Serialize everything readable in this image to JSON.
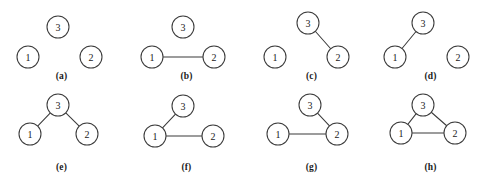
{
  "figure": {
    "node_radius": 11,
    "stroke_color": "#3b3b3b",
    "background_color": "#ffffff",
    "panels": [
      {
        "caption": "(a)",
        "origin": [
          0,
          0
        ],
        "caption_y": 71,
        "nodes": [
          {
            "label": "3",
            "x": 58,
            "y": 27
          },
          {
            "label": "1",
            "x": 28,
            "y": 57
          },
          {
            "label": "2",
            "x": 91,
            "y": 57
          }
        ],
        "edges": []
      },
      {
        "caption": "(b)",
        "origin": [
          125,
          0
        ],
        "caption_y": 71,
        "nodes": [
          {
            "label": "3",
            "x": 58,
            "y": 27
          },
          {
            "label": "1",
            "x": 27,
            "y": 57
          },
          {
            "label": "2",
            "x": 89,
            "y": 57
          }
        ],
        "edges": [
          {
            "from": "1",
            "to": "2"
          }
        ]
      },
      {
        "caption": "(c)",
        "origin": [
          250,
          0
        ],
        "caption_y": 71,
        "nodes": [
          {
            "label": "3",
            "x": 58,
            "y": 23
          },
          {
            "label": "1",
            "x": 25,
            "y": 57
          },
          {
            "label": "2",
            "x": 88,
            "y": 57
          }
        ],
        "edges": [
          {
            "from": "3",
            "to": "2"
          }
        ]
      },
      {
        "caption": "(d)",
        "origin": [
          369,
          0
        ],
        "caption_y": 71,
        "nodes": [
          {
            "label": "3",
            "x": 54,
            "y": 23
          },
          {
            "label": "1",
            "x": 26,
            "y": 57
          },
          {
            "label": "2",
            "x": 89,
            "y": 57
          }
        ],
        "edges": [
          {
            "from": "1",
            "to": "3"
          }
        ]
      },
      {
        "caption": "(e)",
        "origin": [
          0,
          90
        ],
        "caption_y": 72,
        "nodes": [
          {
            "label": "3",
            "x": 58,
            "y": 15
          },
          {
            "label": "1",
            "x": 30,
            "y": 44
          },
          {
            "label": "2",
            "x": 87,
            "y": 44
          }
        ],
        "edges": [
          {
            "from": "3",
            "to": "1"
          },
          {
            "from": "3",
            "to": "2"
          }
        ]
      },
      {
        "caption": "(f)",
        "origin": [
          125,
          90
        ],
        "caption_y": 72,
        "nodes": [
          {
            "label": "3",
            "x": 58,
            "y": 16
          },
          {
            "label": "1",
            "x": 30,
            "y": 46
          },
          {
            "label": "2",
            "x": 88,
            "y": 46
          }
        ],
        "edges": [
          {
            "from": "1",
            "to": "3"
          },
          {
            "from": "1",
            "to": "2"
          }
        ]
      },
      {
        "caption": "(g)",
        "origin": [
          250,
          90
        ],
        "caption_y": 72,
        "nodes": [
          {
            "label": "3",
            "x": 60,
            "y": 15
          },
          {
            "label": "1",
            "x": 28,
            "y": 44
          },
          {
            "label": "2",
            "x": 87,
            "y": 44
          }
        ],
        "edges": [
          {
            "from": "3",
            "to": "2"
          },
          {
            "from": "1",
            "to": "2"
          }
        ]
      },
      {
        "caption": "(h)",
        "origin": [
          369,
          90
        ],
        "caption_y": 72,
        "nodes": [
          {
            "label": "3",
            "x": 54,
            "y": 15
          },
          {
            "label": "1",
            "x": 32,
            "y": 43
          },
          {
            "label": "2",
            "x": 86,
            "y": 43
          }
        ],
        "edges": [
          {
            "from": "1",
            "to": "3"
          },
          {
            "from": "3",
            "to": "2"
          },
          {
            "from": "1",
            "to": "2"
          }
        ]
      }
    ]
  }
}
